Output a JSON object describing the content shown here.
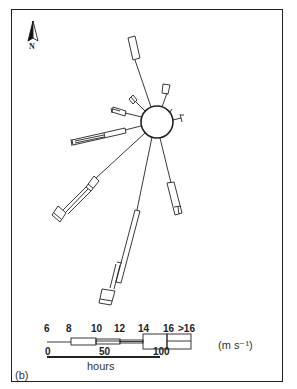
{
  "figure": {
    "panel_label": "(b)",
    "north_label": "N",
    "units": "(m s⁻¹)",
    "legend": {
      "speed_ticks": [
        "6",
        "8",
        "10",
        "12",
        "14",
        "16",
        ">16"
      ],
      "hours_ticks": [
        "0",
        "50",
        "100"
      ],
      "hours_label": "hours"
    },
    "colors": {
      "ink": "#222222",
      "background": "#ffffff"
    }
  }
}
